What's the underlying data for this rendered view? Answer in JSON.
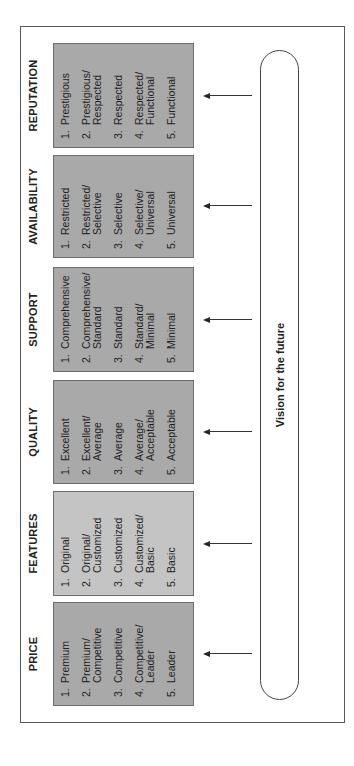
{
  "diagram": {
    "vision_label": "Vision for the future",
    "columns": [
      {
        "title": "PRICE",
        "shade": "dark",
        "items": [
          {
            "num": "1.",
            "text": "Premium"
          },
          {
            "num": "2.",
            "text": "Premium/\nCompetitive"
          },
          {
            "num": "3.",
            "text": "Competitive"
          },
          {
            "num": "4.",
            "text": "Competitive/\nLeader"
          },
          {
            "num": "5.",
            "text": "Leader"
          }
        ]
      },
      {
        "title": "FEATURES",
        "shade": "light",
        "items": [
          {
            "num": "1.",
            "text": "Original"
          },
          {
            "num": "2.",
            "text": "Original/\nCustomized"
          },
          {
            "num": "3.",
            "text": "Customized"
          },
          {
            "num": "4.",
            "text": "Customized/\nBasic"
          },
          {
            "num": "5.",
            "text": "Basic"
          }
        ]
      },
      {
        "title": "QUALITY",
        "shade": "dark",
        "items": [
          {
            "num": "1.",
            "text": "Excellent"
          },
          {
            "num": "2.",
            "text": "Excellent/\nAverage"
          },
          {
            "num": "3.",
            "text": "Average"
          },
          {
            "num": "4.",
            "text": "Average/\nAcceptable"
          },
          {
            "num": "5.",
            "text": "Acceptable"
          }
        ]
      },
      {
        "title": "SUPPORT",
        "shade": "dark",
        "items": [
          {
            "num": "1.",
            "text": "Comprehensive"
          },
          {
            "num": "2.",
            "text": "Comprehensive/\nStandard"
          },
          {
            "num": "3.",
            "text": "Standard"
          },
          {
            "num": "4.",
            "text": "Standard/\nMinimal"
          },
          {
            "num": "5.",
            "text": "Minimal"
          }
        ]
      },
      {
        "title": "AVAILABILITY",
        "shade": "dark",
        "items": [
          {
            "num": "1.",
            "text": "Restricted"
          },
          {
            "num": "2.",
            "text": "Restricted/\nSelective"
          },
          {
            "num": "3.",
            "text": "Selective"
          },
          {
            "num": "4.",
            "text": "Selective/\nUniversal"
          },
          {
            "num": "5.",
            "text": "Universal"
          }
        ]
      },
      {
        "title": "REPUTATION",
        "shade": "dark",
        "items": [
          {
            "num": "1.",
            "text": "Prestigious"
          },
          {
            "num": "2.",
            "text": "Prestigious/\nRespected"
          },
          {
            "num": "3.",
            "text": "Respected"
          },
          {
            "num": "4.",
            "text": "Respected/\nFunctional"
          },
          {
            "num": "5.",
            "text": "Functional"
          }
        ]
      }
    ],
    "colors": {
      "box_dark": "#a9a9a9",
      "box_light": "#c4c4c4",
      "frame": "#5a5a5a",
      "text": "#222222"
    }
  }
}
